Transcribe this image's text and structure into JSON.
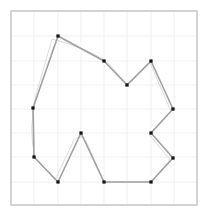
{
  "colors": {
    "background": "#ffffff",
    "frame": "#c8c8c8",
    "grid": "#efefef",
    "polygon_stroke": "#a0a0a0",
    "trace_stroke": "#dcdcdc",
    "vertex": "#111111"
  },
  "frame": {
    "x": 11,
    "y": 11,
    "width": 186,
    "height": 194
  },
  "grid": {
    "x_lines": [
      11,
      34,
      58,
      81,
      104,
      127,
      151,
      174,
      197
    ],
    "y_lines": [
      11,
      36,
      61,
      85,
      109,
      133,
      157,
      182,
      205
    ]
  },
  "polygon": {
    "vertices": [
      [
        58,
        36
      ],
      [
        104,
        61
      ],
      [
        127,
        85
      ],
      [
        151,
        61
      ],
      [
        173,
        109
      ],
      [
        151,
        133
      ],
      [
        173,
        158
      ],
      [
        151,
        182
      ],
      [
        104,
        182
      ],
      [
        81,
        133
      ],
      [
        58,
        182
      ],
      [
        34,
        157
      ],
      [
        33,
        108
      ]
    ],
    "grid_vertices": [
      [
        2,
        1
      ],
      [
        4,
        2
      ],
      [
        5,
        3
      ],
      [
        6,
        2
      ],
      [
        7,
        4
      ],
      [
        6,
        5
      ],
      [
        7,
        6
      ],
      [
        6,
        7
      ],
      [
        4,
        7
      ],
      [
        3,
        5
      ],
      [
        2,
        7
      ],
      [
        1,
        6
      ],
      [
        1,
        4
      ]
    ]
  },
  "trace": {
    "path": "M 52 39 L 36 95 Q 28 130 35 157 L 55 180 L 74 140 Q 80 133 86 141 L 104 182 L 151 182 L 170 160 L 149 134 L 171 111 L 150 63 L 128 85 L 105 60 Q 80 46 52 39 Z"
  }
}
